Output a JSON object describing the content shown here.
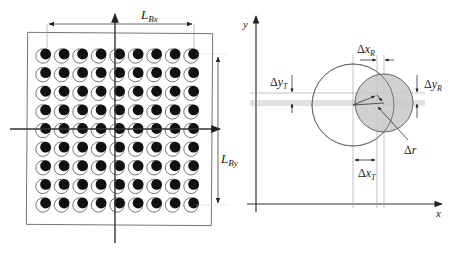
{
  "figure": {
    "left_panel": {
      "title": "Ball grid array with displaced balls",
      "grid": {
        "rows": 9,
        "cols": 9
      },
      "labels": {
        "width_label": {
          "main": "L",
          "sub": "Bx"
        },
        "height_label": {
          "main": "L",
          "sub": "By"
        }
      },
      "marker_legend": {
        "open_circle": "nominal position",
        "filled_dot": "actual position"
      }
    },
    "right_panel": {
      "axes": {
        "x_label": "x",
        "y_label": "y"
      },
      "labels": {
        "dx_R": {
          "delta": "Δ",
          "main": "x",
          "sub": "R"
        },
        "dy_R": {
          "delta": "Δ",
          "main": "y",
          "sub": "R"
        },
        "dy_T": {
          "delta": "Δ",
          "main": "y",
          "sub": "T"
        },
        "dx_T": {
          "delta": "Δ",
          "main": "x",
          "sub": "T"
        },
        "dr": {
          "delta": "Δ",
          "main": "r",
          "sub": ""
        }
      },
      "colors": {
        "shaded_circle": "#c8c8c8",
        "lines": "#555555",
        "thin_lines": "#9a9a9a"
      }
    }
  }
}
